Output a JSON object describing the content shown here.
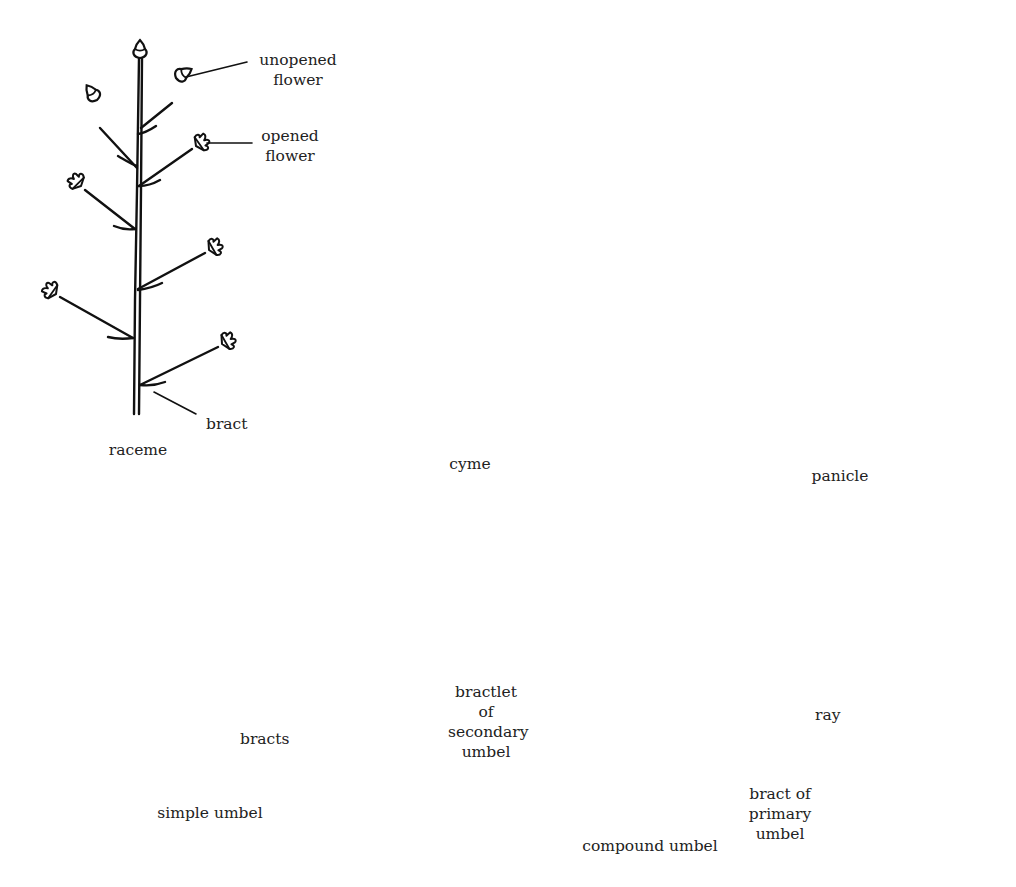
{
  "figure": {
    "panels": [
      {
        "id": "raceme",
        "caption": "raceme"
      },
      {
        "id": "cyme",
        "caption": "cyme"
      },
      {
        "id": "panicle",
        "caption": "panicle"
      },
      {
        "id": "simple-umbel",
        "caption": "simple umbel"
      },
      {
        "id": "compound-umbel",
        "caption": "compound umbel"
      }
    ],
    "annotations": {
      "unopened_flower": [
        "unopened",
        "flower"
      ],
      "opened_flower": [
        "opened",
        "flower"
      ],
      "bract": "bract",
      "bracts": "bracts",
      "bractlet": [
        "bractlet of",
        "secondary",
        "umbel"
      ],
      "ray": "ray",
      "bract_primary": [
        "bract of",
        "primary umbel"
      ]
    },
    "colors": {
      "ink": "#111111",
      "background": "#ffffff",
      "text": "#222222"
    }
  }
}
